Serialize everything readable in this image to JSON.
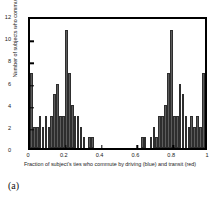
{
  "figure": {
    "caption": "(a)"
  },
  "chart_data": {
    "type": "bar",
    "title": "",
    "subtitle": "",
    "xlabel": "Fraction of subject's ties who commute by driving (blue) and transit (red)",
    "ylabel": "Number of subjects who commute by driving",
    "xlim": [
      0,
      1
    ],
    "ylim": [
      0,
      12
    ],
    "xticks": [
      "0",
      "0.2",
      "0.4",
      "0.6",
      "0.8",
      "1"
    ],
    "xtick_values": [
      0,
      0.2,
      0.4,
      0.6,
      0.8,
      1
    ],
    "yticks": [
      "0",
      "2",
      "4",
      "6",
      "8",
      "10",
      "12"
    ],
    "ytick_values": [
      0,
      2,
      4,
      6,
      8,
      10,
      12
    ],
    "grid": false,
    "legend": null,
    "bin_count": 60,
    "bin_width": 0.0167,
    "bar_color": "#5c5c5c",
    "bar_edge_color": "#2e2e2e",
    "frame_color": "#000000",
    "x": [
      0.008,
      0.025,
      0.042,
      0.058,
      0.075,
      0.092,
      0.108,
      0.125,
      0.142,
      0.158,
      0.175,
      0.192,
      0.208,
      0.225,
      0.242,
      0.258,
      0.275,
      0.292,
      0.308,
      0.325,
      0.342,
      0.358,
      0.375,
      0.392,
      0.408,
      0.425,
      0.442,
      0.458,
      0.475,
      0.492,
      0.508,
      0.525,
      0.542,
      0.558,
      0.575,
      0.592,
      0.608,
      0.625,
      0.642,
      0.658,
      0.675,
      0.692,
      0.708,
      0.725,
      0.742,
      0.758,
      0.775,
      0.792,
      0.808,
      0.825,
      0.842,
      0.858,
      0.875,
      0.892,
      0.908,
      0.925,
      0.942,
      0.958,
      0.975,
      0.992
    ],
    "values": [
      7,
      2,
      2,
      3,
      2,
      3,
      2,
      3,
      5,
      6,
      3,
      3,
      11,
      7,
      4,
      3,
      3,
      2,
      1,
      0,
      1,
      1,
      0,
      0,
      0,
      0,
      0,
      0,
      0,
      0,
      0,
      0,
      0,
      0,
      0,
      0,
      0,
      0,
      1,
      1,
      0,
      1,
      2,
      1,
      3,
      3,
      4,
      7,
      11,
      3,
      3,
      6,
      5,
      3,
      2,
      3,
      2,
      3,
      2,
      7
    ]
  }
}
